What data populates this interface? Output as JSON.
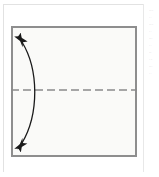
{
  "figure": {
    "type": "origami-fold-diagram",
    "caption": "",
    "background_color": "#ffffff"
  },
  "page_frame": {
    "name": "page-border",
    "color": "#e2e2e2",
    "left": 3,
    "top": 4,
    "width": 141,
    "height": 168
  },
  "margin_column": {
    "name": "adjacent-text-column-sliver",
    "lines": [
      "·····",
      "·  ·",
      "·····",
      "· ·",
      "····",
      "·  ·",
      "···",
      "· ··",
      "····",
      "·  ·"
    ]
  },
  "paper": {
    "name": "paper-square",
    "shape": "square",
    "fill_color": "#f7f7f6",
    "border_color": "#8e8e8e",
    "border_width": 2,
    "x": 11,
    "y": 26,
    "width": 126,
    "height": 131
  },
  "fold_line": {
    "name": "horizontal-fold-line",
    "style": "dashed",
    "meaning": "valley fold / crease",
    "color": "#8a8a8a",
    "y": 90,
    "x_start": 11,
    "x_end": 137,
    "dash": 8,
    "gap": 4,
    "stroke_width": 1.4
  },
  "arrow": {
    "name": "fold-unfold-arrow",
    "style": "curved-double-headed",
    "meaning": "fold in half and unfold",
    "color": "#1a1a1a",
    "stroke_width": 1.3,
    "start": {
      "x": 22,
      "y": 41
    },
    "end": {
      "x": 22,
      "y": 144
    },
    "control": {
      "x": 40,
      "y": 92
    },
    "head_size": 9
  },
  "colors": {
    "ink": "#1a1a1a",
    "paper_fill": "#f7f7f6",
    "paper_edge": "#8e8e8e",
    "crease": "#8a8a8a",
    "page_rule": "#e2e2e2"
  }
}
